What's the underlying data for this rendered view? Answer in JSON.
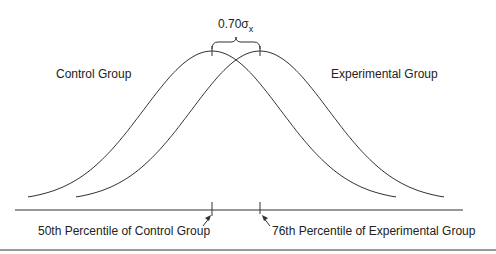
{
  "diagram": {
    "effect_label": "0.70σ",
    "effect_subscript": "x",
    "left_curve_label": "Control Group",
    "right_curve_label": "Experimental Group",
    "left_marker_label": "50th Percentile of Control Group",
    "right_marker_label": "76th Percentile of Experimental Group",
    "colors": {
      "line": "#333333",
      "rule": "#999999",
      "text": "#222222"
    }
  },
  "chart_data": {
    "type": "line",
    "title": "",
    "series": [
      {
        "name": "Control Group",
        "mean": 0,
        "sd": 1
      },
      {
        "name": "Experimental Group",
        "mean": 0.7,
        "sd": 1
      }
    ],
    "annotations": [
      "0.70σx",
      "50th Percentile of Control Group",
      "76th Percentile of Experimental Group"
    ],
    "xlabel": "",
    "ylabel": "",
    "grid": false
  }
}
